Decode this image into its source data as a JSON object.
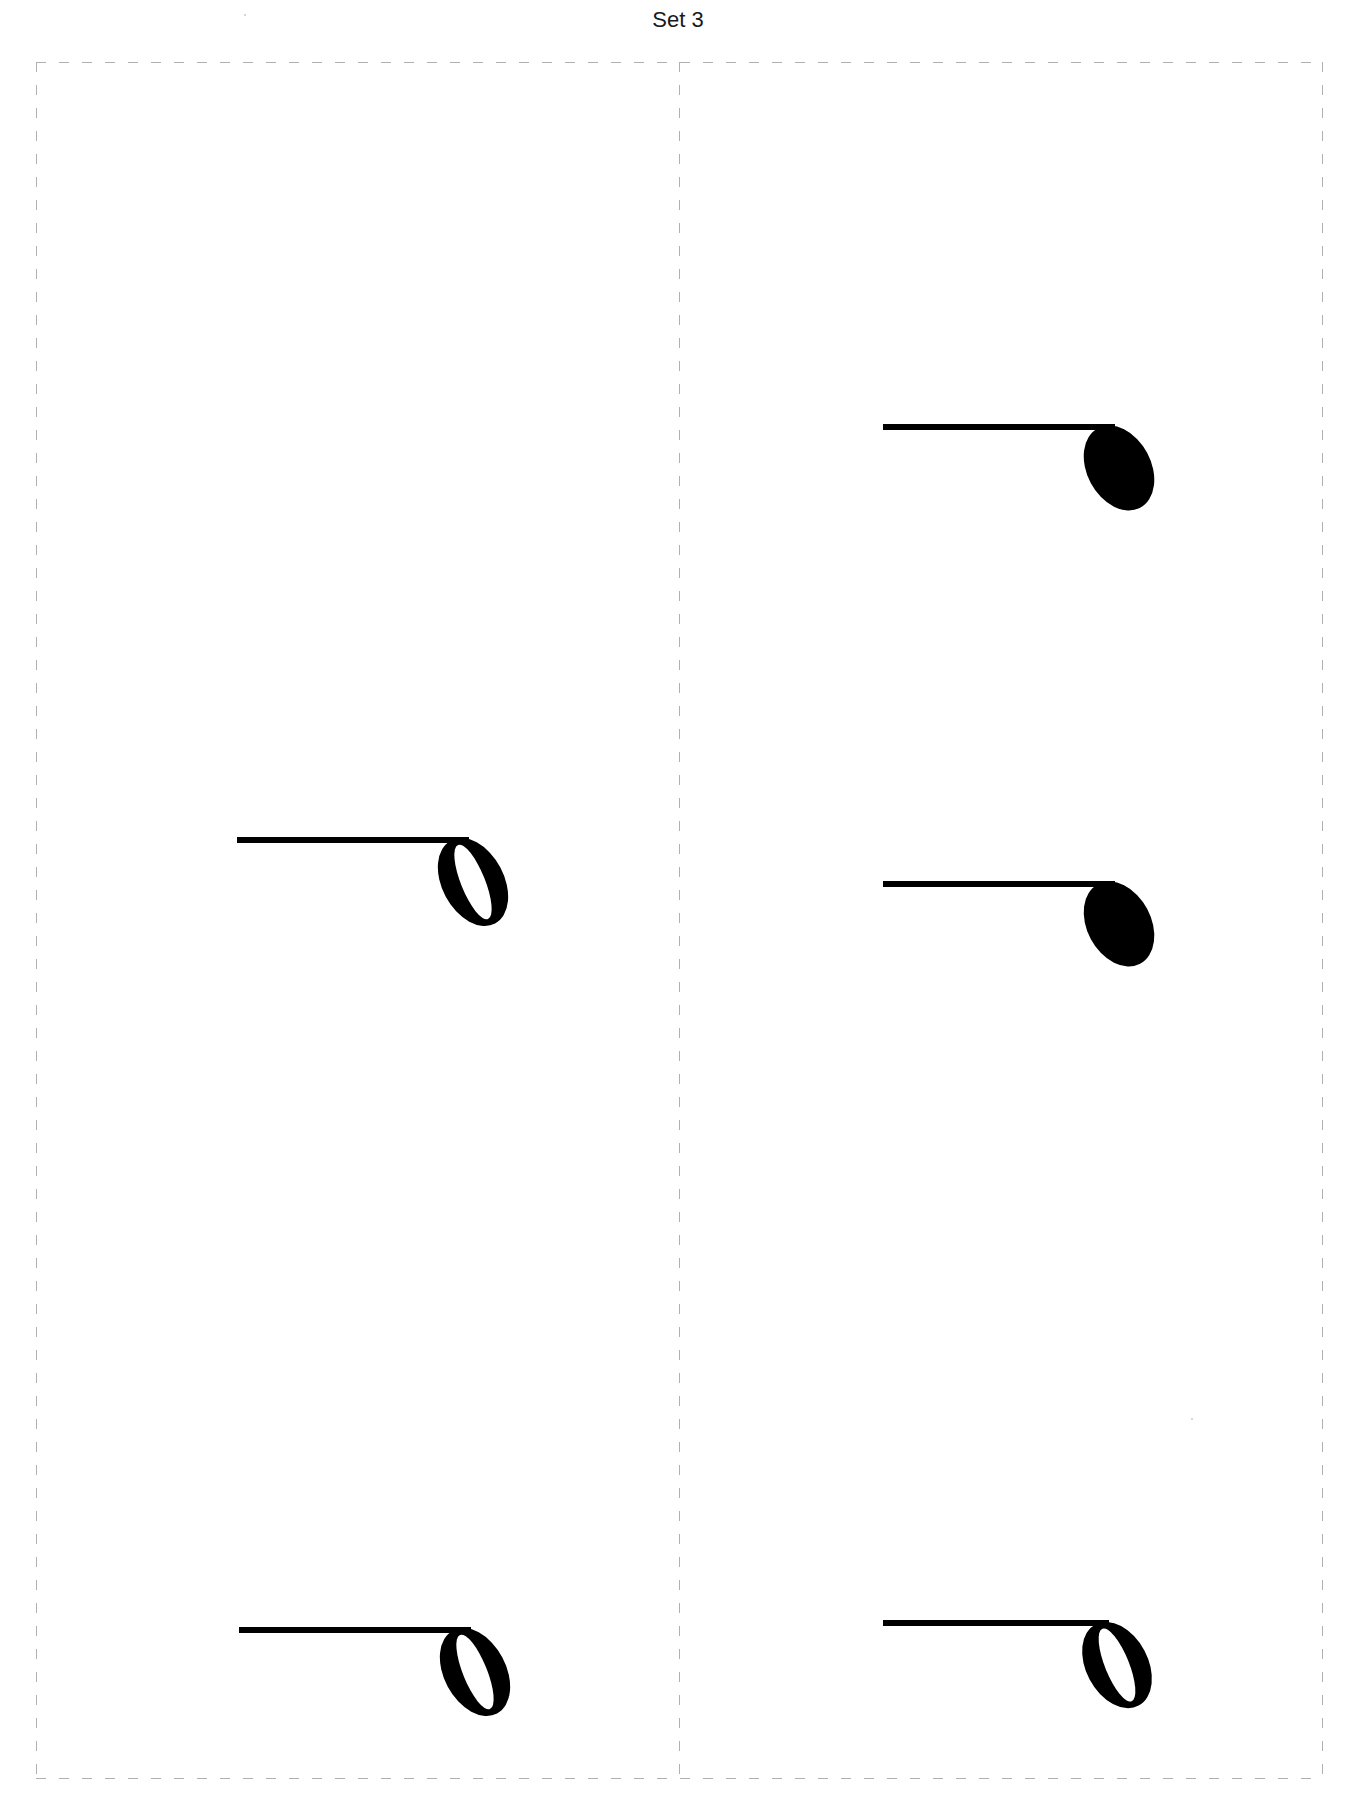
{
  "page": {
    "title": "Set 3",
    "background": "#ffffff",
    "cut_line_color": "#b0b0b0",
    "ink_color": "#000000"
  },
  "cards": [
    {
      "position": "left",
      "notes": [
        {
          "type": "half-note",
          "label": "Half note (rotated)",
          "stem_y": 840,
          "stem_x1": 237,
          "head_x": 473,
          "head_y": 882
        },
        {
          "type": "half-note",
          "label": "Half note (rotated)",
          "stem_y": 1630,
          "stem_x1": 239,
          "head_x": 475,
          "head_y": 1672
        }
      ]
    },
    {
      "position": "right",
      "notes": [
        {
          "type": "quarter-note",
          "label": "Quarter note (rotated)",
          "stem_y": 427,
          "stem_x1": 883,
          "head_x": 1119,
          "head_y": 468
        },
        {
          "type": "quarter-note",
          "label": "Quarter note (rotated)",
          "stem_y": 884,
          "stem_x1": 883,
          "head_x": 1119,
          "head_y": 924
        },
        {
          "type": "half-note",
          "label": "Half note (rotated)",
          "stem_y": 1623,
          "stem_x1": 883,
          "head_x": 1117,
          "head_y": 1666
        }
      ]
    }
  ]
}
